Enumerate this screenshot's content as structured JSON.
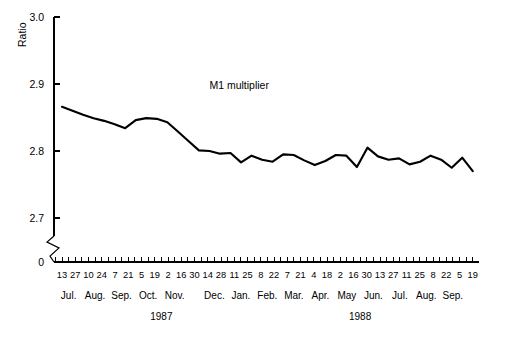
{
  "chart_data": {
    "type": "line",
    "title": "",
    "xlabel": "",
    "ylabel": "Ratio",
    "ylim": [
      2.65,
      3.0
    ],
    "yticks": [
      "3.0",
      "2.9",
      "2.8",
      "2.7"
    ],
    "ytick_values": [
      3.0,
      2.9,
      2.8,
      2.7
    ],
    "axis_break_label": "0",
    "grid": false,
    "legend_position": "inline-annotation",
    "annotations": [
      {
        "text": "M1 multiplier",
        "x_index": 14,
        "y_value": 2.893
      }
    ],
    "series": [
      {
        "name": "M1 multiplier",
        "values": [
          2.866,
          2.86,
          2.854,
          2.849,
          2.845,
          2.84,
          2.834,
          2.846,
          2.849,
          2.848,
          2.843,
          2.829,
          2.815,
          2.801,
          2.8,
          2.796,
          2.797,
          2.783,
          2.793,
          2.787,
          2.784,
          2.795,
          2.794,
          2.786,
          2.779,
          2.785,
          2.794,
          2.793,
          2.776,
          2.805,
          2.792,
          2.787,
          2.789,
          2.78,
          2.784,
          2.793,
          2.787,
          2.775,
          2.79,
          2.77
        ]
      }
    ],
    "x_tick_labels": [
      "13",
      "27",
      "10",
      "24",
      "7",
      "21",
      "5",
      "19",
      "2",
      "16",
      "30",
      "14",
      "28",
      "11",
      "25",
      "8",
      "22",
      "7",
      "21",
      "4",
      "18",
      "2",
      "16",
      "30",
      "13",
      "27",
      "11",
      "25",
      "8",
      "22",
      "5",
      "19"
    ],
    "months": [
      {
        "label": "Jul.",
        "tick_index": 0
      },
      {
        "label": "Aug.",
        "tick_index": 2
      },
      {
        "label": "Sep.",
        "tick_index": 4
      },
      {
        "label": "Oct.",
        "tick_index": 6
      },
      {
        "label": "Nov.",
        "tick_index": 8
      },
      {
        "label": "Dec.",
        "tick_index": 11
      },
      {
        "label": "Jan.",
        "tick_index": 13
      },
      {
        "label": "Feb.",
        "tick_index": 15
      },
      {
        "label": "Mar.",
        "tick_index": 17
      },
      {
        "label": "Apr.",
        "tick_index": 19
      },
      {
        "label": "May",
        "tick_index": 21
      },
      {
        "label": "Jun.",
        "tick_index": 23
      },
      {
        "label": "Jul.",
        "tick_index": 25
      },
      {
        "label": "Aug.",
        "tick_index": 27
      },
      {
        "label": "Sep.",
        "tick_index": 29
      }
    ],
    "years": [
      {
        "label": "1987",
        "tick_index": 7
      },
      {
        "label": "1988",
        "tick_index": 22
      }
    ]
  }
}
